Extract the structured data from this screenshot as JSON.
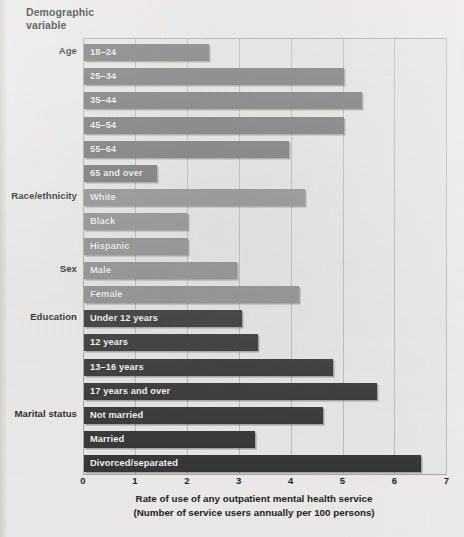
{
  "header": {
    "title_line1": "Demographic",
    "title_line2": "variable"
  },
  "axis": {
    "ticks": [
      "0",
      "1",
      "2",
      "3",
      "4",
      "5",
      "6",
      "7"
    ],
    "caption_line1": "Rate of use of any outpatient mental health service",
    "caption_line2": "(Number of service users annually per 100 persons)"
  },
  "colors": {
    "bar_age": "#6e6e6e",
    "bar_race_sex": "#8d8d8d",
    "bar_edu_marital": "#2e2e2e",
    "plot_background": "#ececea",
    "grid": "#bdbdbb",
    "page_background": "#f2f1ef"
  },
  "groups": [
    {
      "label": "Age",
      "first_row": 0
    },
    {
      "label": "Race/ethnicity",
      "first_row": 6
    },
    {
      "label": "Sex",
      "first_row": 9
    },
    {
      "label": "Education",
      "first_row": 11
    },
    {
      "label": "Marital status",
      "first_row": 15
    }
  ],
  "chart_data": {
    "type": "bar",
    "orientation": "horizontal",
    "title": "",
    "xlabel": "Rate of use of any outpatient mental health service (Number of service users annually per 100 persons)",
    "ylabel": "Demographic variable",
    "xlim": [
      0,
      7
    ],
    "xticks": [
      0,
      1,
      2,
      3,
      4,
      5,
      6,
      7
    ],
    "grid": true,
    "legend": "none",
    "categories": [
      "18–24",
      "25–34",
      "35–44",
      "45–54",
      "55–64",
      "65 and over",
      "White",
      "Black",
      "Hispanic",
      "Male",
      "Female",
      "Under 12 years",
      "12 years",
      "13–16 years",
      "17 years and over",
      "Not married",
      "Married",
      "Divorced/separated"
    ],
    "values": [
      2.4,
      5.0,
      5.35,
      5.0,
      3.95,
      1.4,
      4.25,
      2.0,
      2.0,
      2.95,
      4.15,
      3.05,
      3.35,
      4.8,
      5.65,
      4.6,
      3.3,
      6.5
    ],
    "group_of": [
      "Age",
      "Age",
      "Age",
      "Age",
      "Age",
      "Age",
      "Race/ethnicity",
      "Race/ethnicity",
      "Race/ethnicity",
      "Sex",
      "Sex",
      "Education",
      "Education",
      "Education",
      "Education",
      "Marital status",
      "Marital status",
      "Marital status"
    ]
  }
}
